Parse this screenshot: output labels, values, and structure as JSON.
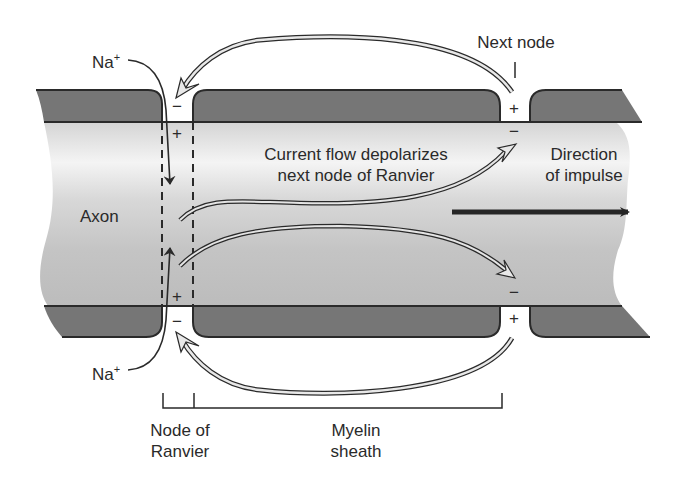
{
  "colors": {
    "background": "#ffffff",
    "myelin": "#767676",
    "axon_light": "#f2f2f2",
    "axon_mid": "#c8c8c8",
    "outline": "#2a2a2a",
    "impulse_arrow": "#262626",
    "current_arrow_fill": "#e8e8e8"
  },
  "labels": {
    "na_top": "Na",
    "na_top_sup": "+",
    "na_bottom": "Na",
    "na_bottom_sup": "+",
    "next_node": "Next node",
    "current_flow_line1": "Current flow depolarizes",
    "current_flow_line2": "next node of Ranvier",
    "direction_line1": "Direction",
    "direction_line2": "of impulse",
    "axon": "Axon",
    "node_of_ranvier_line1": "Node of",
    "node_of_ranvier_line2": "Ranvier",
    "myelin_sheath_line1": "Myelin",
    "myelin_sheath_line2": "sheath"
  },
  "charges": {
    "node_top_outside": "−",
    "node_top_inside": "+",
    "node_bottom_inside": "+",
    "node_bottom_outside": "−",
    "next_top_outside": "+",
    "next_top_inside": "−",
    "next_bottom_inside": "−",
    "next_bottom_outside": "+"
  }
}
